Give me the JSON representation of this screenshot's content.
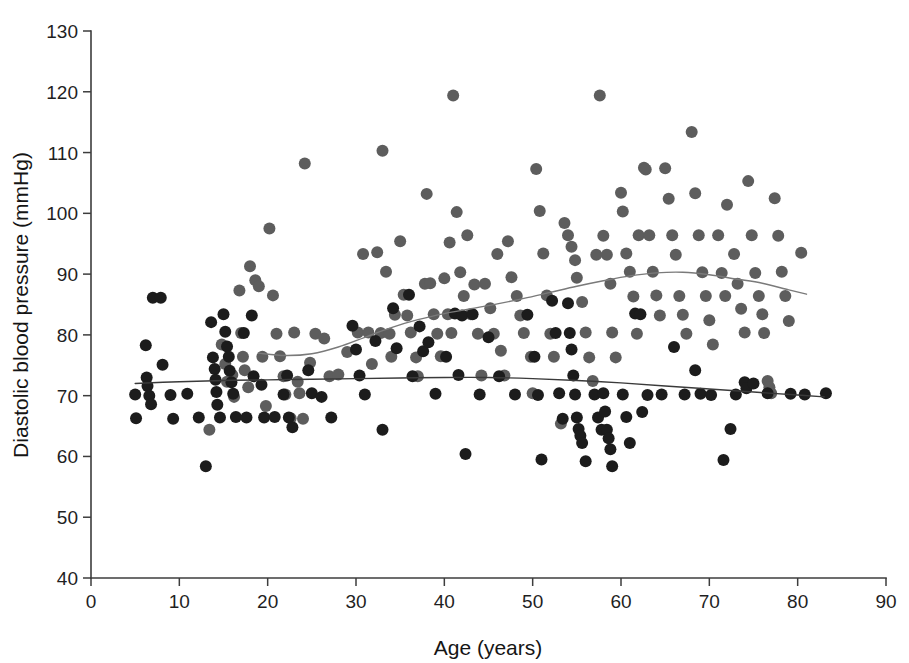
{
  "chart_data": {
    "type": "scatter",
    "title": "",
    "xlabel": "Age (years)",
    "ylabel": "Diastolic blood pressure (mmHg)",
    "xlim": [
      0,
      90
    ],
    "ylim": [
      40,
      130
    ],
    "xticks": [
      0,
      10,
      20,
      30,
      40,
      50,
      60,
      70,
      80,
      90
    ],
    "yticks": [
      40,
      50,
      60,
      70,
      80,
      90,
      100,
      110,
      120,
      130
    ],
    "grid": false,
    "legend": "none",
    "marker_shape": "circle",
    "marker_radius_px": 6,
    "series": [
      {
        "name": "dark-group",
        "color": "#1c1c1c",
        "points": [
          [
            5.0,
            70.2
          ],
          [
            5.1,
            66.3
          ],
          [
            6.2,
            78.3
          ],
          [
            6.3,
            73.0
          ],
          [
            6.4,
            71.6
          ],
          [
            6.6,
            70.0
          ],
          [
            6.8,
            68.6
          ],
          [
            7.0,
            86.1
          ],
          [
            7.9,
            86.1
          ],
          [
            8.1,
            75.1
          ],
          [
            9.0,
            70.1
          ],
          [
            9.3,
            66.2
          ],
          [
            10.9,
            70.3
          ],
          [
            12.2,
            66.4
          ],
          [
            13.0,
            58.4
          ],
          [
            13.6,
            82.1
          ],
          [
            13.8,
            76.3
          ],
          [
            14.0,
            74.4
          ],
          [
            14.1,
            72.6
          ],
          [
            14.2,
            70.6
          ],
          [
            14.3,
            68.5
          ],
          [
            14.6,
            66.4
          ],
          [
            15.0,
            83.4
          ],
          [
            15.2,
            80.5
          ],
          [
            15.4,
            78.1
          ],
          [
            15.6,
            76.4
          ],
          [
            15.7,
            74.1
          ],
          [
            15.9,
            72.2
          ],
          [
            16.1,
            70.3
          ],
          [
            16.4,
            66.5
          ],
          [
            17.3,
            80.3
          ],
          [
            17.6,
            66.4
          ],
          [
            18.2,
            83.2
          ],
          [
            18.4,
            73.2
          ],
          [
            19.3,
            71.8
          ],
          [
            19.6,
            66.4
          ],
          [
            20.8,
            66.5
          ],
          [
            21.8,
            70.2
          ],
          [
            22.2,
            73.3
          ],
          [
            22.4,
            66.4
          ],
          [
            22.8,
            64.8
          ],
          [
            24.6,
            74.2
          ],
          [
            25.0,
            70.4
          ],
          [
            26.1,
            69.8
          ],
          [
            27.2,
            66.4
          ],
          [
            29.6,
            81.5
          ],
          [
            30.0,
            77.6
          ],
          [
            30.4,
            73.3
          ],
          [
            31.0,
            70.2
          ],
          [
            32.2,
            79.0
          ],
          [
            33.0,
            64.4
          ],
          [
            34.2,
            84.4
          ],
          [
            34.6,
            77.8
          ],
          [
            36.0,
            86.6
          ],
          [
            36.4,
            73.2
          ],
          [
            37.2,
            81.4
          ],
          [
            37.6,
            77.3
          ],
          [
            38.2,
            78.8
          ],
          [
            39.0,
            70.3
          ],
          [
            40.2,
            76.4
          ],
          [
            41.2,
            83.5
          ],
          [
            41.6,
            73.4
          ],
          [
            42.0,
            83.2
          ],
          [
            42.4,
            60.4
          ],
          [
            43.2,
            83.4
          ],
          [
            44.0,
            70.2
          ],
          [
            45.0,
            79.6
          ],
          [
            46.2,
            73.2
          ],
          [
            48.0,
            70.2
          ],
          [
            49.4,
            83.3
          ],
          [
            50.2,
            76.4
          ],
          [
            50.6,
            70.1
          ],
          [
            51.0,
            59.5
          ],
          [
            52.2,
            85.6
          ],
          [
            52.6,
            80.3
          ],
          [
            53.0,
            70.4
          ],
          [
            53.4,
            66.2
          ],
          [
            54.0,
            85.2
          ],
          [
            54.2,
            80.3
          ],
          [
            54.4,
            77.6
          ],
          [
            54.6,
            73.3
          ],
          [
            54.8,
            70.2
          ],
          [
            55.0,
            66.4
          ],
          [
            55.2,
            64.5
          ],
          [
            55.4,
            63.4
          ],
          [
            55.6,
            62.2
          ],
          [
            56.0,
            59.2
          ],
          [
            57.0,
            70.2
          ],
          [
            57.4,
            66.4
          ],
          [
            57.8,
            64.4
          ],
          [
            58.0,
            70.4
          ],
          [
            58.2,
            67.4
          ],
          [
            58.4,
            64.4
          ],
          [
            58.6,
            63.0
          ],
          [
            58.8,
            61.2
          ],
          [
            59.0,
            58.4
          ],
          [
            60.2,
            70.2
          ],
          [
            60.6,
            66.5
          ],
          [
            61.0,
            62.2
          ],
          [
            61.6,
            83.5
          ],
          [
            62.2,
            83.4
          ],
          [
            62.4,
            67.3
          ],
          [
            63.0,
            70.1
          ],
          [
            64.6,
            70.2
          ],
          [
            66.0,
            78.0
          ],
          [
            67.2,
            70.2
          ],
          [
            68.4,
            74.2
          ],
          [
            69.0,
            70.3
          ],
          [
            70.2,
            70.1
          ],
          [
            71.6,
            59.4
          ],
          [
            72.4,
            64.5
          ],
          [
            73.0,
            70.2
          ],
          [
            74.0,
            72.2
          ],
          [
            74.2,
            71.2
          ],
          [
            75.0,
            72.0
          ],
          [
            76.6,
            70.4
          ],
          [
            79.2,
            70.3
          ],
          [
            80.8,
            70.2
          ],
          [
            83.2,
            70.4
          ]
        ]
      },
      {
        "name": "gray-group",
        "color": "#5d5d5d",
        "points": [
          [
            13.4,
            64.4
          ],
          [
            14.8,
            78.4
          ],
          [
            15.2,
            75.2
          ],
          [
            15.4,
            72.3
          ],
          [
            16.0,
            73.4
          ],
          [
            16.2,
            69.8
          ],
          [
            16.8,
            87.3
          ],
          [
            17.0,
            80.3
          ],
          [
            17.2,
            76.4
          ],
          [
            17.4,
            74.2
          ],
          [
            17.8,
            71.4
          ],
          [
            18.0,
            91.3
          ],
          [
            18.6,
            89.0
          ],
          [
            19.0,
            88.0
          ],
          [
            19.4,
            76.4
          ],
          [
            19.8,
            68.3
          ],
          [
            20.2,
            97.5
          ],
          [
            20.6,
            86.5
          ],
          [
            21.0,
            80.2
          ],
          [
            21.4,
            76.5
          ],
          [
            21.8,
            73.2
          ],
          [
            22.0,
            70.2
          ],
          [
            22.6,
            66.3
          ],
          [
            23.0,
            80.4
          ],
          [
            23.4,
            72.3
          ],
          [
            23.6,
            70.4
          ],
          [
            24.0,
            66.2
          ],
          [
            24.2,
            108.2
          ],
          [
            24.8,
            75.4
          ],
          [
            25.4,
            80.2
          ],
          [
            26.4,
            79.4
          ],
          [
            27.0,
            73.2
          ],
          [
            28.0,
            73.5
          ],
          [
            29.0,
            77.2
          ],
          [
            30.2,
            80.4
          ],
          [
            30.8,
            93.3
          ],
          [
            31.4,
            80.4
          ],
          [
            31.8,
            75.2
          ],
          [
            32.4,
            93.6
          ],
          [
            32.8,
            80.3
          ],
          [
            33.0,
            110.3
          ],
          [
            33.4,
            90.4
          ],
          [
            33.8,
            80.2
          ],
          [
            34.0,
            76.4
          ],
          [
            34.4,
            83.3
          ],
          [
            35.0,
            95.4
          ],
          [
            35.4,
            86.6
          ],
          [
            35.8,
            83.2
          ],
          [
            36.2,
            80.4
          ],
          [
            36.8,
            76.3
          ],
          [
            37.0,
            73.2
          ],
          [
            37.8,
            88.4
          ],
          [
            38.0,
            103.2
          ],
          [
            38.4,
            88.5
          ],
          [
            38.8,
            83.4
          ],
          [
            39.2,
            80.2
          ],
          [
            39.6,
            76.5
          ],
          [
            40.0,
            89.3
          ],
          [
            40.4,
            83.4
          ],
          [
            40.6,
            95.2
          ],
          [
            40.8,
            80.3
          ],
          [
            41.0,
            119.4
          ],
          [
            41.4,
            100.2
          ],
          [
            41.8,
            90.3
          ],
          [
            42.2,
            86.4
          ],
          [
            42.6,
            96.4
          ],
          [
            43.0,
            83.4
          ],
          [
            43.4,
            88.3
          ],
          [
            43.8,
            80.2
          ],
          [
            44.2,
            73.3
          ],
          [
            44.6,
            88.4
          ],
          [
            45.2,
            84.4
          ],
          [
            45.6,
            80.2
          ],
          [
            46.0,
            93.3
          ],
          [
            46.4,
            77.4
          ],
          [
            46.8,
            73.3
          ],
          [
            47.2,
            95.4
          ],
          [
            47.6,
            89.5
          ],
          [
            48.2,
            86.4
          ],
          [
            48.6,
            83.2
          ],
          [
            49.0,
            80.3
          ],
          [
            49.8,
            76.4
          ],
          [
            50.0,
            70.4
          ],
          [
            50.4,
            107.3
          ],
          [
            50.8,
            100.4
          ],
          [
            51.2,
            93.4
          ],
          [
            51.6,
            86.5
          ],
          [
            52.0,
            80.2
          ],
          [
            52.4,
            76.4
          ],
          [
            53.2,
            65.4
          ],
          [
            53.6,
            98.4
          ],
          [
            54.0,
            96.4
          ],
          [
            54.4,
            94.5
          ],
          [
            54.8,
            92.3
          ],
          [
            55.0,
            89.4
          ],
          [
            55.6,
            85.4
          ],
          [
            56.0,
            80.4
          ],
          [
            56.4,
            76.3
          ],
          [
            56.8,
            72.4
          ],
          [
            57.2,
            93.2
          ],
          [
            57.6,
            119.4
          ],
          [
            58.0,
            96.3
          ],
          [
            58.4,
            93.2
          ],
          [
            58.8,
            88.4
          ],
          [
            59.0,
            80.4
          ],
          [
            59.4,
            76.3
          ],
          [
            60.0,
            103.4
          ],
          [
            60.2,
            100.3
          ],
          [
            60.6,
            93.4
          ],
          [
            61.0,
            90.4
          ],
          [
            61.4,
            86.3
          ],
          [
            61.8,
            80.2
          ],
          [
            62.0,
            96.4
          ],
          [
            62.6,
            107.5
          ],
          [
            62.8,
            107.2
          ],
          [
            63.2,
            96.4
          ],
          [
            63.6,
            90.4
          ],
          [
            64.0,
            86.5
          ],
          [
            64.4,
            83.2
          ],
          [
            65.0,
            107.4
          ],
          [
            65.4,
            102.4
          ],
          [
            65.8,
            96.4
          ],
          [
            66.2,
            93.2
          ],
          [
            66.6,
            86.4
          ],
          [
            67.0,
            83.3
          ],
          [
            67.4,
            80.2
          ],
          [
            68.0,
            113.4
          ],
          [
            68.4,
            103.3
          ],
          [
            68.8,
            96.4
          ],
          [
            69.2,
            90.3
          ],
          [
            69.6,
            86.4
          ],
          [
            70.0,
            82.4
          ],
          [
            70.4,
            78.4
          ],
          [
            71.0,
            96.4
          ],
          [
            71.4,
            90.2
          ],
          [
            71.8,
            86.4
          ],
          [
            72.0,
            101.4
          ],
          [
            72.8,
            93.3
          ],
          [
            73.2,
            88.4
          ],
          [
            73.6,
            84.3
          ],
          [
            74.0,
            80.4
          ],
          [
            74.4,
            105.3
          ],
          [
            74.8,
            96.4
          ],
          [
            75.2,
            90.2
          ],
          [
            75.6,
            86.4
          ],
          [
            76.0,
            83.4
          ],
          [
            76.2,
            80.3
          ],
          [
            76.6,
            72.4
          ],
          [
            76.8,
            71.4
          ],
          [
            77.0,
            70.4
          ],
          [
            77.4,
            102.5
          ],
          [
            77.8,
            96.3
          ],
          [
            78.2,
            90.4
          ],
          [
            78.6,
            86.4
          ],
          [
            79.0,
            82.3
          ],
          [
            80.4,
            93.5
          ]
        ]
      }
    ],
    "trend_lines": [
      {
        "name": "dark-trend",
        "color": "#3a3a3a",
        "x": [
          5,
          10,
          15,
          20,
          25,
          30,
          35,
          40,
          45,
          50,
          55,
          60,
          65,
          70,
          75,
          80,
          83
        ],
        "y": [
          72.0,
          72.3,
          72.5,
          72.6,
          72.7,
          72.8,
          72.9,
          73.0,
          73.0,
          72.8,
          72.5,
          72.1,
          71.6,
          71.1,
          70.6,
          70.1,
          69.8
        ]
      },
      {
        "name": "gray-trend",
        "color": "#7a7a7a",
        "x": [
          19,
          22,
          25,
          28,
          31,
          34,
          37,
          40,
          43,
          46,
          49,
          52,
          55,
          58,
          61,
          64,
          67,
          70,
          73,
          76,
          79,
          81
        ],
        "y": [
          77.0,
          76.6,
          76.9,
          78.0,
          79.6,
          81.2,
          82.5,
          83.5,
          84.3,
          85.1,
          86.0,
          87.0,
          88.0,
          88.9,
          89.7,
          90.2,
          90.3,
          89.9,
          89.2,
          88.5,
          87.4,
          86.7
        ]
      }
    ]
  },
  "axis": {
    "y_tick_labels": [
      "40",
      "50",
      "60",
      "70",
      "80",
      "90",
      "100",
      "110",
      "120",
      "130"
    ],
    "x_tick_labels": [
      "0",
      "10",
      "20",
      "30",
      "40",
      "50",
      "60",
      "70",
      "80",
      "90"
    ],
    "x_title": "Age (years)",
    "y_title": "Diastolic blood pressure (mmHg)"
  }
}
